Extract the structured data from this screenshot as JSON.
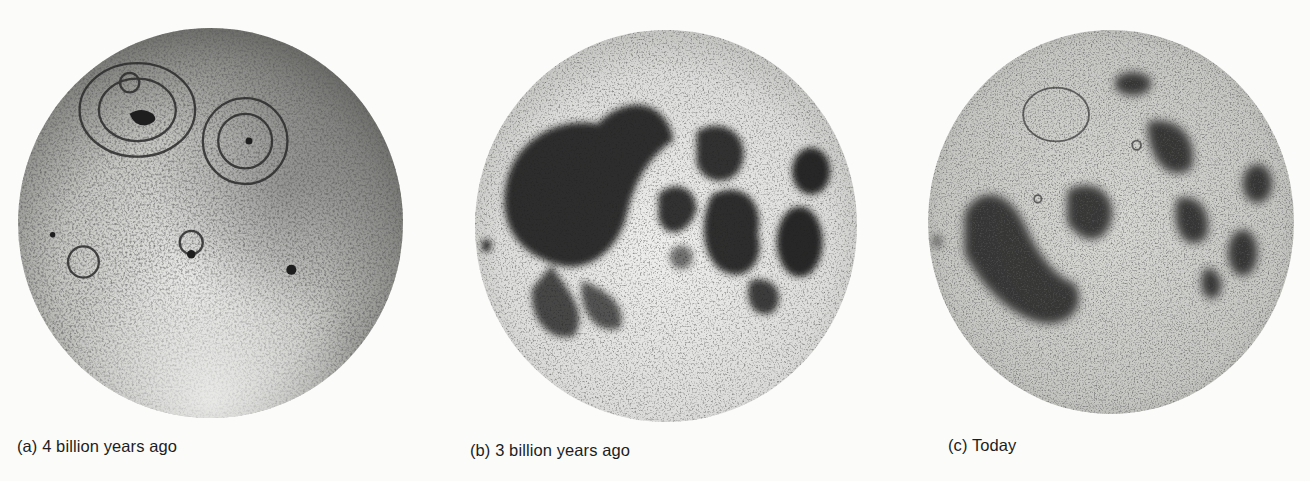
{
  "figure": {
    "panels": [
      {
        "id": "a",
        "caption": "(a) 4 billion years ago",
        "subject": "Moon surface with scattered impact basins, no dark maria",
        "colors": {
          "surface_light": "#e8e8e6",
          "surface_mid": "#b9b9b6",
          "feature_dark": "#2b2b2b"
        }
      },
      {
        "id": "b",
        "caption": "(b) 3 billion years ago",
        "subject": "Moon with basins flooded by large dark lava maria",
        "colors": {
          "surface_light": "#f0f0ee",
          "surface_mid": "#c8c8c5",
          "feature_dark": "#1c1c1c"
        }
      },
      {
        "id": "c",
        "caption": "(c) Today",
        "subject": "Present-day Moon with maria overprinted by later craters",
        "colors": {
          "surface_light": "#e2e2df",
          "surface_mid": "#b4b4b0",
          "feature_dark": "#202020"
        }
      }
    ]
  }
}
